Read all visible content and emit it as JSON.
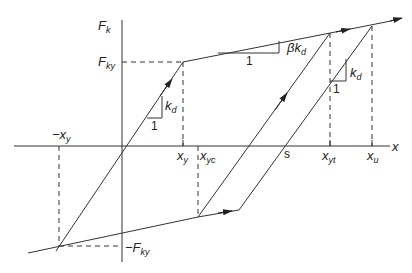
{
  "diagram": {
    "type": "bilinear hysteresis loop (force-displacement)",
    "axes": {
      "vertical_label": "F",
      "vertical_label_sub": "k",
      "horizontal_label": "x"
    },
    "labels": {
      "fky": {
        "main": "F",
        "sub": "ky"
      },
      "neg_fky": {
        "main": "−F",
        "sub": "ky"
      },
      "neg_xy": {
        "main": "−x",
        "sub": "y"
      },
      "xy": {
        "main": "x",
        "sub": "y"
      },
      "xyc": {
        "main": "x",
        "sub": "yc"
      },
      "s": {
        "main": "s"
      },
      "xyt": {
        "main": "x",
        "sub": "yt"
      },
      "xu": {
        "main": "x",
        "sub": "u"
      }
    },
    "slope_triangles": [
      {
        "run": "1",
        "rise_main": "k",
        "rise_sub": "d"
      },
      {
        "run": "1",
        "rise_main": "βk",
        "rise_sub": "d"
      },
      {
        "run": "1",
        "rise_main": "k",
        "rise_sub": "d"
      }
    ],
    "colors": {
      "line": "#333333",
      "background": "#ffffff"
    }
  }
}
